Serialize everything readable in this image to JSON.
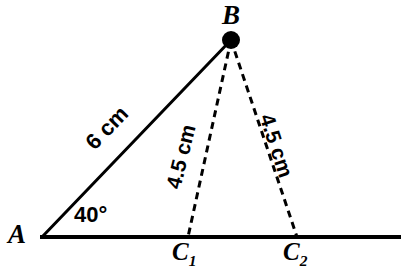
{
  "figure": {
    "type": "geometry-diagram",
    "background_color": "#ffffff",
    "stroke_color": "#000000"
  },
  "points": {
    "A": {
      "label": "A",
      "x": 42,
      "y": 237
    },
    "B": {
      "label": "B",
      "x": 231,
      "y": 40,
      "marker": "filled-dot",
      "marker_radius": 9
    },
    "C1": {
      "label": "C",
      "subscript": "1",
      "x": 188,
      "y": 237
    },
    "C2": {
      "label": "C",
      "subscript": "2",
      "x": 297,
      "y": 237
    }
  },
  "segments": {
    "baseline": {
      "name": "base-ray",
      "from": {
        "x": 40,
        "y": 237
      },
      "to": {
        "x": 401,
        "y": 237
      },
      "style": "solid",
      "width": 4
    },
    "AB": {
      "name": "segment-ab",
      "from": {
        "x": 42,
        "y": 237
      },
      "to": {
        "x": 231,
        "y": 40
      },
      "style": "solid",
      "width": 3,
      "length_label": "6 cm"
    },
    "BC1": {
      "name": "segment-bc1",
      "from": {
        "x": 231,
        "y": 40
      },
      "to": {
        "x": 188,
        "y": 237
      },
      "style": "dashed",
      "width": 3,
      "dash": "7 5",
      "length_label": "4.5 cm"
    },
    "BC2": {
      "name": "segment-bc2",
      "from": {
        "x": 231,
        "y": 40
      },
      "to": {
        "x": 297,
        "y": 237
      },
      "style": "dashed",
      "width": 3,
      "dash": "7 5",
      "length_label": "4.5 cm"
    }
  },
  "angles": {
    "at_A": {
      "name": "angle-a",
      "value": "40°",
      "degrees": 40,
      "vertex": "A"
    }
  },
  "labels": {
    "point_a": "A",
    "point_b": "B",
    "point_c_base": "C",
    "point_c1_sub": "1",
    "point_c2_sub": "2",
    "side_ab": "6 cm",
    "side_bc1": "4.5 cm",
    "side_bc2": "4.5 cm",
    "angle_a": "40°"
  }
}
